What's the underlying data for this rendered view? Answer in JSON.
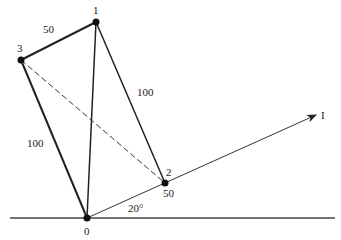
{
  "diagram": {
    "nodes": [
      {
        "id": "0",
        "label": "0",
        "x": 87,
        "y": 218
      },
      {
        "id": "1",
        "label": "1",
        "x": 96,
        "y": 22
      },
      {
        "id": "2",
        "label": "2",
        "x": 165,
        "y": 183
      },
      {
        "id": "3",
        "label": "3",
        "x": 21,
        "y": 60
      }
    ],
    "edge_labels": {
      "e31": "50",
      "e12": "100",
      "e30": "100",
      "e2": "50"
    },
    "angle_label": "20°",
    "vector_label": "I"
  }
}
